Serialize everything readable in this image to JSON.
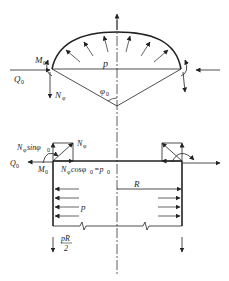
{
  "diagram": {
    "title": "",
    "top_figure": {
      "labels": {
        "moment": "M",
        "moment_sub": "0",
        "shear": "Q",
        "shear_sub": "0",
        "normal": "N",
        "normal_sub": "φ",
        "pressure": "p",
        "angle": "φ",
        "angle_sub": "0"
      }
    },
    "bottom_figure": {
      "labels": {
        "nsin": "N",
        "nsin_sub": "φ",
        "nsin_rest": "sinφ",
        "nsin_rest_sub": "0",
        "n": "N",
        "n_sub": "φ",
        "shear": "Q",
        "shear_sub": "0",
        "moment": "M",
        "moment_sub": "0",
        "ncos": "N",
        "ncos_sub": "φ",
        "ncos_rest": "cosφ",
        "ncos_rest_sub": "0",
        "ncos_eq": "=p",
        "ncos_eq_sub": "0",
        "radius": "R",
        "pressure": "p",
        "axial_num": "pR",
        "axial_den": "2"
      }
    },
    "colors": {
      "stroke": "#222222",
      "dashed_axis": "#333333"
    }
  }
}
